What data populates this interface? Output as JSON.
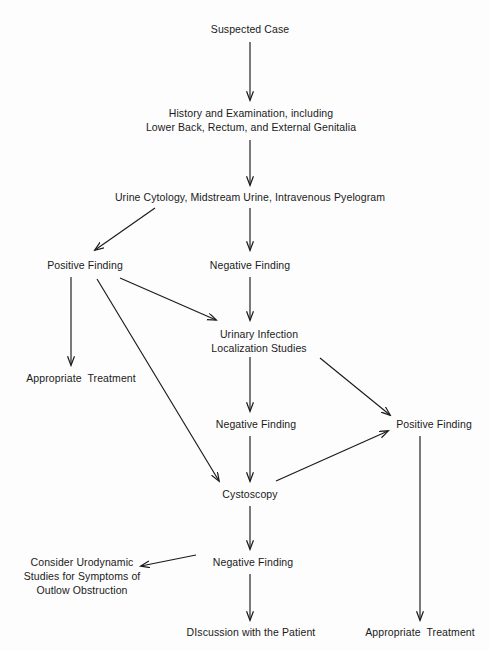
{
  "diagram": {
    "background_color": "#fdfdfd",
    "ink_color": "#1a1a1a",
    "width": 489,
    "height": 651
  },
  "nodes": [
    {
      "id": "suspected_case",
      "lines": [
        "Suspected Case"
      ],
      "x": 250,
      "y": 29
    },
    {
      "id": "history_exam",
      "lines": [
        "History and Examination, including",
        "Lower Back, Rectum, and External Genitalia"
      ],
      "x": 251,
      "y": 120
    },
    {
      "id": "urine_cytology",
      "lines": [
        "Urine Cytology, Midstream Urine, Intravenous Pyelogram"
      ],
      "x": 250,
      "y": 197
    },
    {
      "id": "positive_finding_1",
      "lines": [
        "Positive Finding"
      ],
      "x": 85,
      "y": 265
    },
    {
      "id": "negative_finding_1",
      "lines": [
        "Negative Finding"
      ],
      "x": 250,
      "y": 265
    },
    {
      "id": "appropriate_treatment_1",
      "lines": [
        "Appropriate  Treatment"
      ],
      "x": 81,
      "y": 378
    },
    {
      "id": "urinary_infection",
      "lines": [
        "Urinary Infection",
        "Localization Studies"
      ],
      "x": 259,
      "y": 341
    },
    {
      "id": "negative_finding_2",
      "lines": [
        "Negative Finding"
      ],
      "x": 256,
      "y": 424
    },
    {
      "id": "positive_finding_2",
      "lines": [
        "Positive Finding"
      ],
      "x": 434,
      "y": 424
    },
    {
      "id": "cystoscopy",
      "lines": [
        "Cystoscopy"
      ],
      "x": 250,
      "y": 494
    },
    {
      "id": "negative_finding_3",
      "lines": [
        "Negative Finding"
      ],
      "x": 253,
      "y": 562
    },
    {
      "id": "consider_urodynamic",
      "lines": [
        "Consider Urodynamic",
        "Studies for Symptoms of",
        "Outlow Obstruction"
      ],
      "x": 82,
      "y": 576
    },
    {
      "id": "discussion_patient",
      "lines": [
        "DIscussion with the Patient"
      ],
      "x": 251,
      "y": 632
    },
    {
      "id": "appropriate_treatment_2",
      "lines": [
        "Appropriate  Treatment"
      ],
      "x": 420,
      "y": 632
    }
  ],
  "edges": [
    {
      "id": "e-suspected-history",
      "from": "suspected_case",
      "to": "history_exam",
      "x1": 250,
      "y1": 42,
      "x2": 250,
      "y2": 100,
      "arrow": true
    },
    {
      "id": "e-history-urine",
      "from": "history_exam",
      "to": "urine_cytology",
      "x1": 250,
      "y1": 140,
      "x2": 250,
      "y2": 185,
      "arrow": true
    },
    {
      "id": "e-urine-positive",
      "from": "urine_cytology",
      "to": "positive_finding_1",
      "x1": 155,
      "y1": 208,
      "x2": 95,
      "y2": 250,
      "arrow": true
    },
    {
      "id": "e-urine-negative",
      "from": "urine_cytology",
      "to": "negative_finding_1",
      "x1": 250,
      "y1": 208,
      "x2": 250,
      "y2": 250,
      "arrow": true
    },
    {
      "id": "e-positive-treatment",
      "from": "positive_finding_1",
      "to": "appropriate_treatment_1",
      "x1": 71,
      "y1": 277,
      "x2": 71,
      "y2": 365,
      "arrow": true
    },
    {
      "id": "e-positive-urinary",
      "from": "positive_finding_1",
      "to": "urinary_infection",
      "x1": 120,
      "y1": 278,
      "x2": 216,
      "y2": 320,
      "arrow": true
    },
    {
      "id": "e-positive-cystoscopy",
      "from": "positive_finding_1",
      "to": "cystoscopy",
      "x1": 97,
      "y1": 279,
      "x2": 219,
      "y2": 481,
      "arrow": true
    },
    {
      "id": "e-negative-urinary",
      "from": "negative_finding_1",
      "to": "urinary_infection",
      "x1": 250,
      "y1": 277,
      "x2": 250,
      "y2": 320,
      "arrow": true
    },
    {
      "id": "e-urinary-negative2",
      "from": "urinary_infection",
      "to": "negative_finding_2",
      "x1": 250,
      "y1": 357,
      "x2": 250,
      "y2": 411,
      "arrow": true
    },
    {
      "id": "e-urinary-positive2",
      "from": "urinary_infection",
      "to": "positive_finding_2",
      "x1": 320,
      "y1": 358,
      "x2": 390,
      "y2": 415,
      "arrow": true
    },
    {
      "id": "e-negative2-cystoscopy",
      "from": "negative_finding_2",
      "to": "cystoscopy",
      "x1": 250,
      "y1": 436,
      "x2": 250,
      "y2": 481,
      "arrow": true
    },
    {
      "id": "e-cystoscopy-positive2",
      "from": "cystoscopy",
      "to": "positive_finding_2",
      "x1": 276,
      "y1": 481,
      "x2": 388,
      "y2": 431,
      "arrow": true
    },
    {
      "id": "e-cystoscopy-negative3",
      "from": "cystoscopy",
      "to": "negative_finding_3",
      "x1": 250,
      "y1": 506,
      "x2": 250,
      "y2": 549,
      "arrow": true
    },
    {
      "id": "e-negative3-urodynamic",
      "from": "negative_finding_3",
      "to": "consider_urodynamic",
      "x1": 196,
      "y1": 555,
      "x2": 141,
      "y2": 566,
      "arrow": true
    },
    {
      "id": "e-negative3-discussion",
      "from": "negative_finding_3",
      "to": "discussion_patient",
      "x1": 250,
      "y1": 574,
      "x2": 250,
      "y2": 620,
      "arrow": true
    },
    {
      "id": "e-positive2-treatment2",
      "from": "positive_finding_2",
      "to": "appropriate_treatment_2",
      "x1": 420,
      "y1": 436,
      "x2": 420,
      "y2": 620,
      "arrow": true
    }
  ]
}
